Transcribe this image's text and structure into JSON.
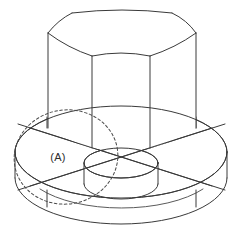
{
  "figure": {
    "domain": "Diagram",
    "background_color": "#ffffff",
    "line_color": "#3a3a3a",
    "hidden_line_color": "#4a4a4a",
    "text_color": "#2d2d2d",
    "canvas": {
      "width": 242,
      "height": 247
    }
  },
  "annotations": {
    "section_label": "(A)",
    "section_label_position": {
      "x": 58,
      "y": 157
    }
  },
  "components": {
    "hex_boss": {
      "name": "hexagonal prism boss",
      "top_vertices": [
        {
          "x": 48,
          "y": 33
        },
        {
          "x": 92,
          "y": 56
        },
        {
          "x": 150,
          "y": 56
        },
        {
          "x": 196,
          "y": 33
        },
        {
          "x": 172,
          "y": 13
        },
        {
          "x": 72,
          "y": 13
        }
      ],
      "vertical_edges_x": [
        48,
        92,
        150,
        196
      ],
      "base_y_left": 128,
      "base_y_center": 148,
      "top_arc_bulge": 6
    },
    "flange_disc": {
      "name": "circular flange base",
      "center": {
        "x": 121,
        "y": 152
      },
      "radius_x": 106,
      "radius_y": 46,
      "thickness": 26
    },
    "inner_cylinder": {
      "name": "central raised cylinder",
      "center": {
        "x": 121,
        "y": 163
      },
      "radius_x": 37,
      "radius_y": 15,
      "height": 26
    },
    "dashed_circle": {
      "name": "section plane circle (A)",
      "center": {
        "x": 66,
        "y": 157
      },
      "radius_x": 52,
      "radius_y": 47,
      "rotation_deg": -10,
      "style": "dashed"
    },
    "cross_ribs": {
      "name": "crossing rib lines",
      "lines": [
        {
          "x1": 16,
          "y1": 191,
          "x2": 227,
          "y2": 124
        },
        {
          "x1": 16,
          "y1": 124,
          "x2": 227,
          "y2": 191
        }
      ]
    }
  }
}
